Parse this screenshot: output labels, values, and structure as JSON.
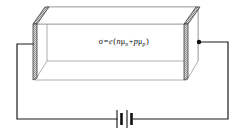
{
  "figure": {
    "background_color": "#ffffff",
    "line_color": "#1a1a1a",
    "thin_line_color": "#8c8c8c",
    "electrode_fill": "#c9c9c9",
    "electrode_edge": "#3d3d3d",
    "width": 245,
    "height": 131
  },
  "formula": {
    "full_text": "σ = e(nμn + pμp)",
    "sigma": "σ",
    "equals": "=",
    "charge": "e",
    "open_paren": "(",
    "n_carrier": "n",
    "mu_n": "μ",
    "mu_n_sub": "n",
    "plus": "+",
    "p_carrier": "p",
    "mu_p": "μ",
    "mu_p_sub": "p",
    "close_paren": ")"
  },
  "components": {
    "semiconductor_block_label": "semiconductor-block",
    "left_electrode_label": "left-electrode",
    "right_electrode_label": "right-electrode",
    "battery_label": "battery",
    "wire_label": "circuit-wire",
    "terminal_dot_label": "right-terminal-dot"
  },
  "colors": {
    "wire": "#1a1a1a",
    "block_outline": "#8c8c8c",
    "electrode_hatch_dark": "#8a8a8a",
    "electrode_hatch_light": "#dcdcdc",
    "battery_plate": "#111111"
  }
}
